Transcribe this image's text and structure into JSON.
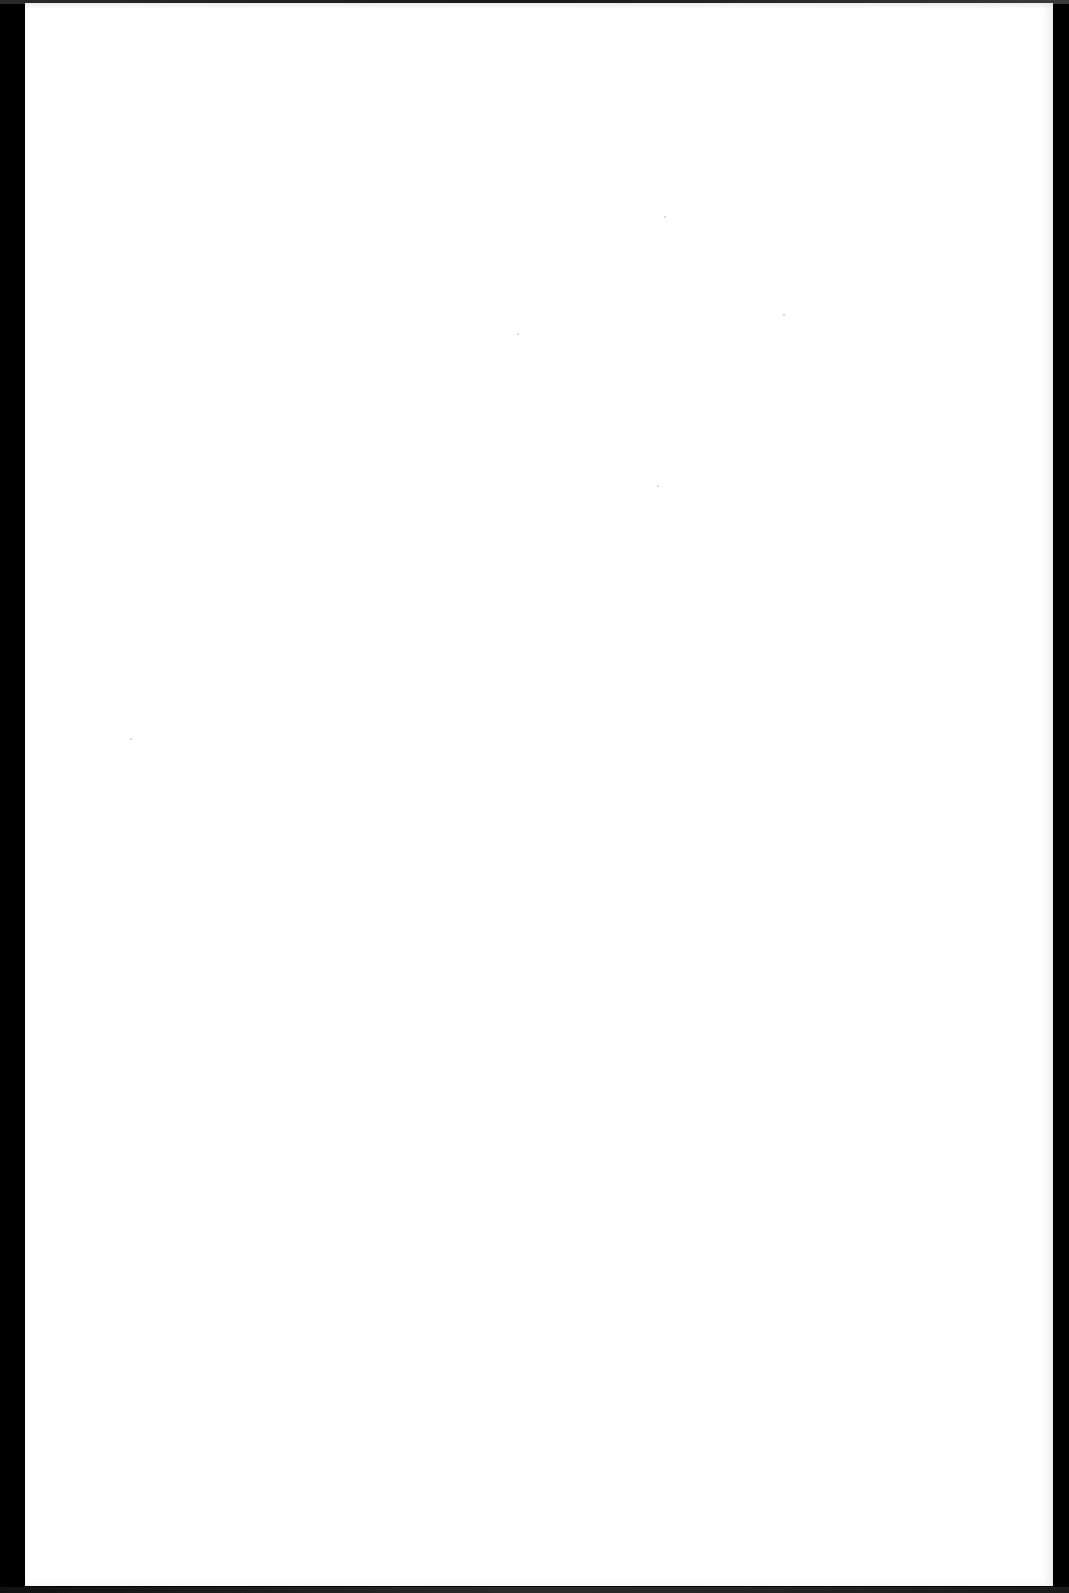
{
  "document": {
    "type": "blank scanned page",
    "content_text": "",
    "colors": {
      "page_background": "#ffffff",
      "scan_border": "#000000"
    }
  }
}
